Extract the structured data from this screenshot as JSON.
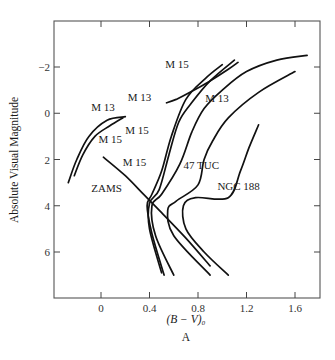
{
  "chart_data": {
    "type": "line",
    "title": "",
    "panel_label": "A",
    "xlabel": "(B − V)₀",
    "ylabel": "Absolute Visual Magnitude",
    "xlim": [
      -0.38,
      1.81
    ],
    "ylim": [
      8.0,
      -4.0
    ],
    "x_ticks": [
      0,
      0.4,
      0.8,
      1.2,
      1.6
    ],
    "x_tick_labels": [
      "0",
      "0.4",
      "0.8",
      "1.2",
      "1.6"
    ],
    "y_ticks": [
      -2,
      0,
      2,
      4,
      6
    ],
    "y_tick_labels": [
      "−2",
      "0",
      "2",
      "4",
      "6"
    ],
    "y_inverted": true,
    "grid": false,
    "series": [
      {
        "name": "ZAMS",
        "points": [
          [
            0.02,
            1.9
          ],
          [
            0.2,
            2.7
          ],
          [
            0.35,
            3.5
          ],
          [
            0.5,
            4.3
          ],
          [
            0.7,
            5.4
          ],
          [
            0.9,
            6.6
          ]
        ]
      },
      {
        "name": "M 13 (horizontal branch)",
        "points": [
          [
            -0.27,
            3.0
          ],
          [
            -0.2,
            2.0
          ],
          [
            -0.1,
            1.0
          ],
          [
            0.05,
            0.3
          ],
          [
            0.2,
            0.15
          ]
        ]
      },
      {
        "name": "M 15 (horizontal branch)",
        "points": [
          [
            -0.22,
            2.7
          ],
          [
            -0.15,
            1.8
          ],
          [
            -0.05,
            1.0
          ],
          [
            0.07,
            0.55
          ],
          [
            0.18,
            0.2
          ]
        ]
      },
      {
        "name": "M 15 (giant branch)",
        "points": [
          [
            0.52,
            7.0
          ],
          [
            0.42,
            5.2
          ],
          [
            0.38,
            4.0
          ],
          [
            0.42,
            3.5
          ],
          [
            0.5,
            2.5
          ],
          [
            0.58,
            1.0
          ],
          [
            0.7,
            -0.6
          ],
          [
            0.86,
            -1.5
          ],
          [
            1.0,
            -2.1
          ]
        ]
      },
      {
        "name": "M 15 (giant branch, upper)",
        "points": [
          [
            0.5,
            6.9
          ],
          [
            0.4,
            5.0
          ],
          [
            0.4,
            3.9
          ],
          [
            0.48,
            3.3
          ],
          [
            0.56,
            1.8
          ],
          [
            0.64,
            0.4
          ],
          [
            0.74,
            -0.4
          ],
          [
            0.9,
            -1.4
          ],
          [
            1.1,
            -2.3
          ]
        ]
      },
      {
        "name": "M 13 (giant branch)",
        "points": [
          [
            0.6,
            7.0
          ],
          [
            0.45,
            5.3
          ],
          [
            0.42,
            4.0
          ],
          [
            0.5,
            3.5
          ],
          [
            0.65,
            2.2
          ],
          [
            0.75,
            0.8
          ],
          [
            0.85,
            -0.2
          ],
          [
            1.0,
            -1.0
          ],
          [
            1.2,
            -1.8
          ],
          [
            1.45,
            -2.3
          ],
          [
            1.7,
            -2.5
          ]
        ]
      },
      {
        "name": "M 13 (upper giant branch)",
        "points": [
          [
            0.54,
            -0.45
          ],
          [
            0.62,
            -0.6
          ],
          [
            0.75,
            -0.95
          ],
          [
            0.9,
            -1.4
          ],
          [
            1.05,
            -1.9
          ],
          [
            1.13,
            -2.2
          ]
        ]
      },
      {
        "name": "47 TUC",
        "points": [
          [
            0.9,
            7.0
          ],
          [
            0.6,
            5.3
          ],
          [
            0.55,
            4.2
          ],
          [
            0.62,
            3.8
          ],
          [
            0.8,
            3.1
          ],
          [
            0.85,
            2.0
          ],
          [
            0.92,
            1.2
          ],
          [
            1.05,
            0.2
          ],
          [
            1.3,
            -0.9
          ],
          [
            1.6,
            -1.8
          ]
        ]
      },
      {
        "name": "NGC 188",
        "points": [
          [
            1.05,
            7.0
          ],
          [
            0.85,
            6.0
          ],
          [
            0.7,
            5.0
          ],
          [
            0.68,
            4.0
          ],
          [
            0.78,
            3.65
          ],
          [
            1.05,
            3.65
          ],
          [
            1.15,
            2.5
          ],
          [
            1.22,
            1.5
          ],
          [
            1.3,
            0.5
          ]
        ]
      }
    ],
    "annotations": [
      {
        "text": "M 13",
        "x": -0.08,
        "y": -0.1
      },
      {
        "text": "M 15",
        "x": -0.02,
        "y": 1.3
      },
      {
        "text": "ZAMS",
        "x": -0.08,
        "y": 3.4
      },
      {
        "text": "M 15",
        "x": 0.53,
        "y": -1.95
      },
      {
        "text": "M 13",
        "x": 0.22,
        "y": -0.55
      },
      {
        "text": "M 15",
        "x": 0.2,
        "y": 0.9
      },
      {
        "text": "M 13",
        "x": 0.86,
        "y": -0.5
      },
      {
        "text": "M 15",
        "x": 0.18,
        "y": 2.3
      },
      {
        "text": "47 TUC",
        "x": 0.68,
        "y": 2.4
      },
      {
        "text": "NGC 188",
        "x": 0.96,
        "y": 3.3
      }
    ]
  },
  "axes": {
    "xlabel": "(B − V)₀",
    "ylabel": "Absolute Visual Magnitude",
    "panel": "A"
  }
}
